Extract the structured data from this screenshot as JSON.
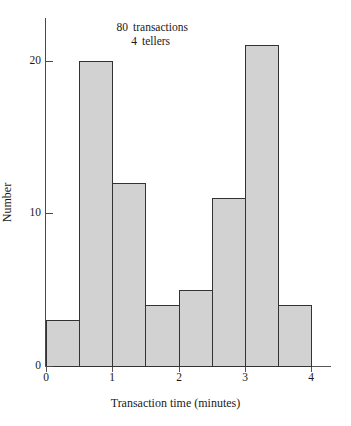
{
  "chart_data": {
    "type": "bar",
    "title": "",
    "subtitle": "",
    "xlabel": "Transaction time (minutes)",
    "ylabel": "Number",
    "categories": [
      "0.0-0.5",
      "0.5-1.0",
      "1.0-1.5",
      "1.5-2.0",
      "2.0-2.5",
      "2.5-3.0",
      "3.0-3.5",
      "3.5-4.0"
    ],
    "bin_edges": [
      0,
      0.5,
      1.0,
      1.5,
      2.0,
      2.5,
      3.0,
      3.5,
      4.0
    ],
    "bin_width": 0.5,
    "values": [
      3,
      20,
      12,
      4,
      5,
      11,
      21,
      4
    ],
    "xlim": [
      0,
      4
    ],
    "ylim": [
      0,
      22.8
    ],
    "xticks": [
      "0",
      "1",
      "2",
      "3",
      "4"
    ],
    "xtick_values": [
      0,
      1,
      2,
      3,
      4
    ],
    "yticks": [
      "0",
      "10",
      "20"
    ],
    "ytick_values": [
      0,
      10,
      20
    ],
    "grid": false,
    "legend": "none",
    "annotations": [
      {
        "value": "80",
        "label": "transactions"
      },
      {
        "value": "4",
        "label": "tellers"
      }
    ],
    "bar_fill_color": "#d2d2d2",
    "bar_edge_color": "#333333",
    "axis_color": "#4a4a4a",
    "background_color": "#ffffff"
  }
}
